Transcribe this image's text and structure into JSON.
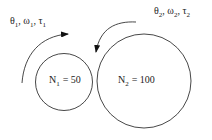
{
  "diagram": {
    "type": "gear-pair",
    "gear1": {
      "label": "N",
      "subscript": "1",
      "value": "= 50",
      "state_label": {
        "theta": "θ",
        "omega": "ω",
        "tau": "τ",
        "sub": "1"
      },
      "rotation": "clockwise"
    },
    "gear2": {
      "label": "N",
      "subscript": "2",
      "value": "= 100",
      "state_label": {
        "theta": "θ",
        "omega": "ω",
        "tau": "τ",
        "sub": "2"
      },
      "rotation": "counter-clockwise"
    },
    "colors": {
      "line": "#333333",
      "text": "#222222"
    }
  }
}
